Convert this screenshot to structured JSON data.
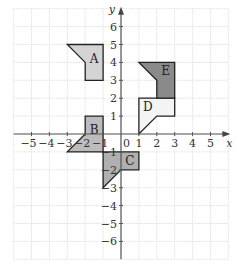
{
  "diagram": {
    "type": "coordinate-grid-transformations",
    "x_axis": {
      "label": "x",
      "min": -6,
      "max": 6,
      "ticks": [
        -5,
        -4,
        -3,
        -2,
        -1,
        1,
        2,
        3,
        4,
        5
      ]
    },
    "y_axis": {
      "label": "y",
      "min": -7,
      "max": 7,
      "ticks": [
        6,
        5,
        4,
        3,
        2,
        1,
        -1,
        -2,
        -3,
        -4,
        -5,
        -6
      ]
    },
    "origin_label": "0",
    "shapes": [
      {
        "id": "A",
        "label": "A",
        "fill": "#d4d4d4",
        "points": [
          [
            -3,
            5
          ],
          [
            -1,
            5
          ],
          [
            -1,
            3
          ],
          [
            -2,
            3
          ],
          [
            -2,
            4
          ]
        ],
        "label_pos": [
          -1.5,
          4.2
        ]
      },
      {
        "id": "B",
        "label": "B",
        "fill": "#bcbcbc",
        "points": [
          [
            -2,
            1
          ],
          [
            -1,
            1
          ],
          [
            -1,
            -1
          ],
          [
            -3,
            -1
          ],
          [
            -2,
            0
          ]
        ],
        "label_pos": [
          -1.5,
          0.2
        ]
      },
      {
        "id": "C",
        "label": "C",
        "fill": "#b0b0b0",
        "points": [
          [
            -1,
            -1
          ],
          [
            1,
            -1
          ],
          [
            1,
            -2
          ],
          [
            0,
            -2
          ],
          [
            -1,
            -3
          ]
        ],
        "label_pos": [
          0.5,
          -1.5
        ]
      },
      {
        "id": "D",
        "label": "D",
        "fill": "#f4f4f4",
        "points": [
          [
            1,
            2
          ],
          [
            3,
            2
          ],
          [
            3,
            1
          ],
          [
            2,
            1
          ],
          [
            1,
            0
          ]
        ],
        "label_pos": [
          1.5,
          1.5
        ]
      },
      {
        "id": "E",
        "label": "E",
        "fill": "#8a8a8a",
        "points": [
          [
            1,
            4
          ],
          [
            3,
            4
          ],
          [
            3,
            2
          ],
          [
            2,
            2
          ],
          [
            2,
            3
          ]
        ],
        "label_pos": [
          2.5,
          3.5
        ]
      }
    ]
  }
}
